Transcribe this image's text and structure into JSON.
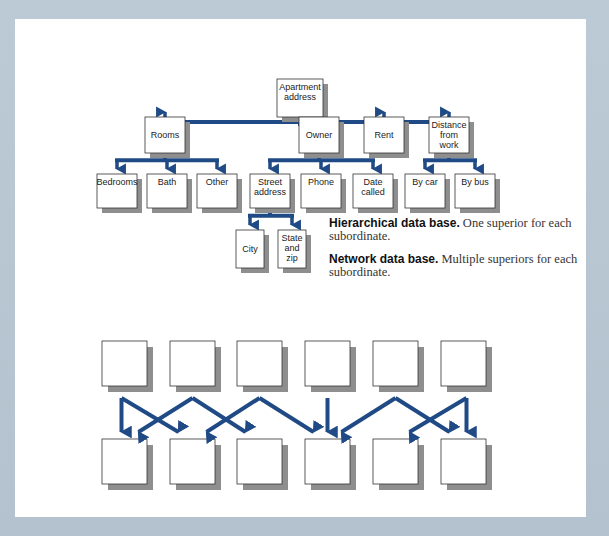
{
  "colors": {
    "arrow": "#1f4a85",
    "background": "#b9c6d3",
    "panel": "#ffffff",
    "box_border": "#333333",
    "box_shadow": "#8e8e8e"
  },
  "hierarchy": {
    "root": {
      "id": "apartment",
      "label": [
        "Apartment",
        "address"
      ]
    },
    "nodes": [
      {
        "id": "rooms",
        "label": [
          "Rooms"
        ],
        "parent": "apartment"
      },
      {
        "id": "owner",
        "label": [
          "Owner"
        ],
        "parent": "apartment"
      },
      {
        "id": "rent",
        "label": [
          "Rent"
        ],
        "parent": "apartment"
      },
      {
        "id": "distance",
        "label": [
          "Distance",
          "from",
          "work"
        ],
        "parent": "apartment"
      },
      {
        "id": "bedrooms",
        "label": [
          "Bedrooms"
        ],
        "parent": "rooms"
      },
      {
        "id": "bath",
        "label": [
          "Bath"
        ],
        "parent": "rooms"
      },
      {
        "id": "other",
        "label": [
          "Other"
        ],
        "parent": "rooms"
      },
      {
        "id": "street",
        "label": [
          "Street",
          "address"
        ],
        "parent": "owner"
      },
      {
        "id": "phone",
        "label": [
          "Phone"
        ],
        "parent": "owner"
      },
      {
        "id": "datecalled",
        "label": [
          "Date",
          "called"
        ],
        "parent": "owner"
      },
      {
        "id": "bycar",
        "label": [
          "By car"
        ],
        "parent": "distance"
      },
      {
        "id": "bybus",
        "label": [
          "By bus"
        ],
        "parent": "distance"
      },
      {
        "id": "city",
        "label": [
          "City"
        ],
        "parent": "street"
      },
      {
        "id": "statezip",
        "label": [
          "State",
          "and",
          "zip"
        ],
        "parent": "street"
      }
    ]
  },
  "captions": {
    "hierarchical": {
      "lead": "Hierarchical data base.",
      "text": " One superior for each subordinate."
    },
    "network": {
      "lead": "Network data base.",
      "text": " Multiple superiors for each subordinate."
    }
  },
  "network": {
    "top_count": 6,
    "bottom_count": 6,
    "edges": [
      {
        "from": 1,
        "to": 1
      },
      {
        "from": 1,
        "to": 2
      },
      {
        "from": 2,
        "to": 1
      },
      {
        "from": 2,
        "to": 3
      },
      {
        "from": 3,
        "to": 2
      },
      {
        "from": 3,
        "to": 4
      },
      {
        "from": 4,
        "to": 4
      },
      {
        "from": 5,
        "to": 4
      },
      {
        "from": 5,
        "to": 6
      },
      {
        "from": 6,
        "to": 5
      },
      {
        "from": 6,
        "to": 6
      }
    ]
  }
}
